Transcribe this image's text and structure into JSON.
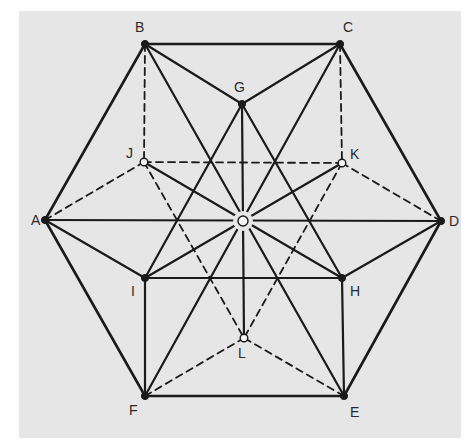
{
  "diagram": {
    "background": "#e6e6e6",
    "line_color": "#1a1a1a",
    "points": [
      {
        "id": "A",
        "x": 45,
        "y": 220,
        "filled": true,
        "label_dx": -14,
        "label_dy": 5
      },
      {
        "id": "B",
        "x": 145,
        "y": 44,
        "filled": true,
        "label_dx": -10,
        "label_dy": -12
      },
      {
        "id": "C",
        "x": 340,
        "y": 44,
        "filled": true,
        "label_dx": 3,
        "label_dy": -12
      },
      {
        "id": "D",
        "x": 441,
        "y": 221,
        "filled": true,
        "label_dx": 8,
        "label_dy": 5
      },
      {
        "id": "E",
        "x": 344,
        "y": 396,
        "filled": true,
        "label_dx": 6,
        "label_dy": 21
      },
      {
        "id": "F",
        "x": 145,
        "y": 396,
        "filled": true,
        "label_dx": -16,
        "label_dy": 19
      },
      {
        "id": "G",
        "x": 242,
        "y": 104,
        "filled": true,
        "label_dx": -8,
        "label_dy": -12
      },
      {
        "id": "H",
        "x": 342,
        "y": 278,
        "filled": true,
        "label_dx": 8,
        "label_dy": 18
      },
      {
        "id": "I",
        "x": 145,
        "y": 278,
        "filled": true,
        "label_dx": -14,
        "label_dy": 18
      },
      {
        "id": "J",
        "x": 144,
        "y": 162,
        "filled": false,
        "label_dx": -18,
        "label_dy": -4
      },
      {
        "id": "K",
        "x": 342,
        "y": 163,
        "filled": false,
        "label_dx": 8,
        "label_dy": -4
      },
      {
        "id": "L",
        "x": 244,
        "y": 338,
        "filled": false,
        "label_dx": -6,
        "label_dy": 20
      },
      {
        "id": "O",
        "x": 243,
        "y": 221,
        "filled": false,
        "center": true,
        "label_dx": -5,
        "label_dy": 5
      }
    ],
    "solid_edges": [
      [
        "A",
        "B"
      ],
      [
        "B",
        "C"
      ],
      [
        "C",
        "D"
      ],
      [
        "D",
        "E"
      ],
      [
        "E",
        "F"
      ],
      [
        "F",
        "A"
      ],
      [
        "B",
        "G"
      ],
      [
        "C",
        "G"
      ],
      [
        "G",
        "I"
      ],
      [
        "G",
        "H"
      ],
      [
        "I",
        "H"
      ],
      [
        "I",
        "F"
      ],
      [
        "H",
        "E"
      ],
      [
        "A",
        "I"
      ],
      [
        "D",
        "H"
      ],
      [
        "A",
        "D"
      ],
      [
        "B",
        "E"
      ],
      [
        "C",
        "F"
      ],
      [
        "J",
        "H"
      ],
      [
        "K",
        "I"
      ],
      [
        "G",
        "L"
      ]
    ],
    "dashed_edges": [
      [
        "B",
        "J"
      ],
      [
        "C",
        "K"
      ],
      [
        "J",
        "K"
      ],
      [
        "A",
        "J"
      ],
      [
        "D",
        "K"
      ],
      [
        "J",
        "L"
      ],
      [
        "K",
        "L"
      ],
      [
        "F",
        "L"
      ],
      [
        "E",
        "L"
      ]
    ]
  }
}
